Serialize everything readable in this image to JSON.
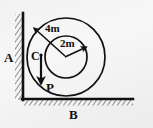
{
  "figure": {
    "name": "concentric-circles-wall-ground-diagram",
    "background_color": "#f2f2f2",
    "ink_color": "#111111",
    "labels": {
      "wall": "A",
      "ground": "B",
      "center": "C",
      "point": "P",
      "outer_radius": "4m",
      "inner_radius": "2m"
    },
    "geometry": {
      "outer_circle": {
        "cx": 66,
        "cy": 57,
        "r": 39
      },
      "inner_circle": {
        "cx": 66,
        "cy": 57,
        "r": 21
      },
      "wall_x": 23,
      "wall_y_top": 14,
      "wall_y_bottom": 99,
      "ground_y": 99,
      "ground_x_left": 23,
      "ground_x_right": 133,
      "arrow_outer": {
        "x1": 66,
        "y1": 57,
        "x2": 33,
        "y2": 27
      },
      "arrow_inner": {
        "x1": 66,
        "y1": 57,
        "x2": 88,
        "y2": 46
      },
      "arrow_down": {
        "x1": 41,
        "y1": 55,
        "x2": 41,
        "y2": 86
      }
    }
  }
}
